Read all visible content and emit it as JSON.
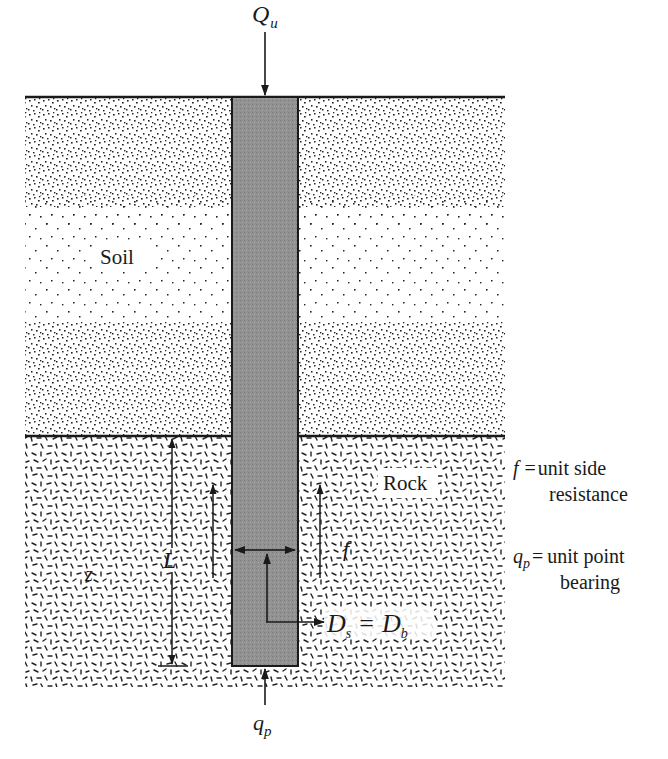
{
  "figure": {
    "load_label": {
      "main": "Q",
      "sub": "u"
    },
    "point_label": {
      "main": "q",
      "sub": "p"
    },
    "soil_label": "Soil",
    "rock_label": "Rock",
    "length_label": "L",
    "depth_label": "z",
    "side_label": "f",
    "diameter_label": {
      "d1": "D",
      "s1": "s",
      "eq": "=",
      "d2": "D",
      "s2": "b"
    }
  },
  "legend": {
    "f_symbol": "f",
    "f_eq": "=",
    "f_line1": "unit side",
    "f_line2": "resistance",
    "qp_symbol": "q",
    "qp_sub": "p",
    "qp_eq": "=",
    "qp_line1": "unit point",
    "qp_line2": "bearing"
  },
  "colors": {
    "pile_fill": "#8f8f8f",
    "line": "#1a1a1a",
    "background": "#ffffff"
  }
}
